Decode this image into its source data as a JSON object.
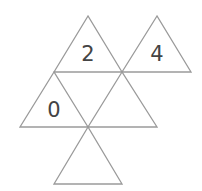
{
  "diagram": {
    "type": "triangle-number-puzzle",
    "stroke_color": "#9a9a9a",
    "text_color": "#444444",
    "background": "#ffffff",
    "triangles": [
      {
        "id": "top-left",
        "label": "2",
        "points": "88,16 54,72 122,72",
        "label_x": 88,
        "label_y": 54
      },
      {
        "id": "top-right",
        "label": "4",
        "points": "157,16 122,72 191,72",
        "label_x": 157,
        "label_y": 54
      },
      {
        "id": "middle-left",
        "label": "0",
        "points": "54,72 20,127 88,127",
        "label_x": 54,
        "label_y": 110
      },
      {
        "id": "middle-right",
        "label": "",
        "points": "122,72 88,127 157,127",
        "label_x": 122,
        "label_y": 110
      },
      {
        "id": "bottom",
        "label": "",
        "points": "88,127 54,184 122,184",
        "label_x": 88,
        "label_y": 166
      }
    ]
  }
}
